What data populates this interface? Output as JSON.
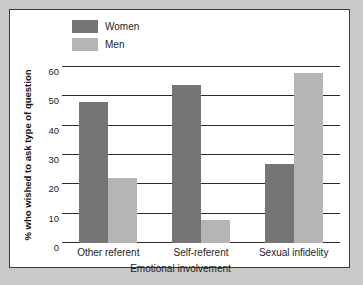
{
  "chart_data": {
    "type": "bar",
    "title": "",
    "categories": [
      "Other referent",
      "Self-referent",
      "Sexual infidelity"
    ],
    "series": [
      {
        "name": "Women",
        "color": "#757575",
        "values": [
          48,
          54,
          27
        ]
      },
      {
        "name": "Men",
        "color": "#b5b5b5",
        "values": [
          22,
          8,
          58
        ]
      }
    ],
    "xlabel": "Emotional involvement",
    "ylabel": "% who wished to ask type of question",
    "ylim": [
      0,
      60
    ],
    "yticks": [
      "0",
      "10",
      "20",
      "30",
      "40",
      "50",
      "60"
    ],
    "grid": true,
    "legend_position": "top-left"
  }
}
